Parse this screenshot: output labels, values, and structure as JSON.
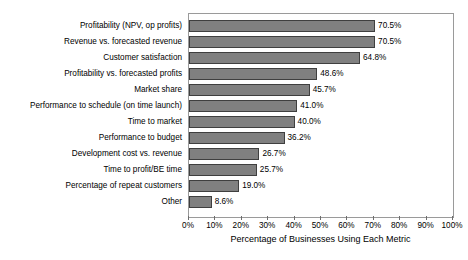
{
  "chart_data": {
    "type": "bar",
    "orientation": "horizontal",
    "title": "",
    "xlabel": "Percentage of Businesses Using Each Metric",
    "ylabel": "",
    "xlim": [
      0,
      100
    ],
    "xtick_labels": [
      "0%",
      "10%",
      "20%",
      "30%",
      "40%",
      "50%",
      "60%",
      "70%",
      "80%",
      "90%",
      "100%"
    ],
    "xtick_values": [
      0,
      10,
      20,
      30,
      40,
      50,
      60,
      70,
      80,
      90,
      100
    ],
    "grid": false,
    "legend": false,
    "bar_color": "#808080",
    "bar_border_color": "#3f3f3f",
    "plot_border_color": "#9a9a9a",
    "background_color": "#ffffff",
    "categories": [
      "Profitability (NPV, op profits)",
      "Revenue vs. forecasted revenue",
      "Customer satisfaction",
      "Profitability vs. forecasted profits",
      "Market share",
      "Performance to schedule (on time launch)",
      "Time to market",
      "Performance to budget",
      "Development cost vs. revenue",
      "Time to profit/BE time",
      "Percentage of repeat customers",
      "Other"
    ],
    "values": [
      70.5,
      70.5,
      64.8,
      48.6,
      45.7,
      41.0,
      40.0,
      36.2,
      26.7,
      25.7,
      19.0,
      8.6
    ],
    "value_labels": [
      "70.5%",
      "70.5%",
      "64.8%",
      "48.6%",
      "45.7%",
      "41.0%",
      "40.0%",
      "36.2%",
      "26.7%",
      "25.7%",
      "19.0%",
      "8.6%"
    ]
  }
}
